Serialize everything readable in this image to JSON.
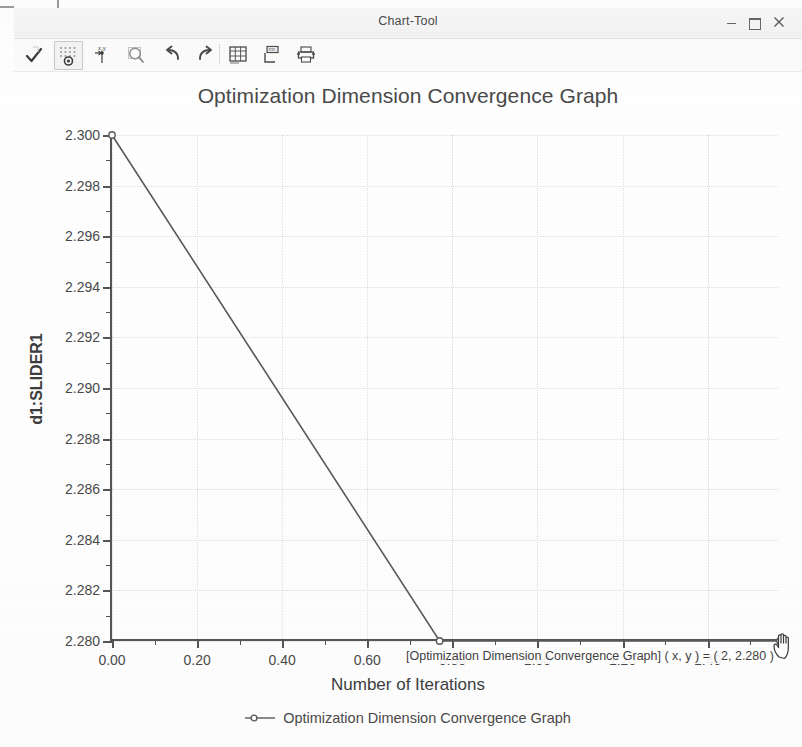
{
  "window": {
    "title": "Chart-Tool",
    "controls": {
      "minimize": "–",
      "maximize": "❐",
      "close": "×"
    }
  },
  "toolbar": {
    "items": [
      {
        "name": "accept-check-icon",
        "label": "Accept",
        "active": false
      },
      {
        "name": "data-points-grid-icon",
        "label": "Show Data Points",
        "active": true
      },
      {
        "name": "xy-crosshair-icon",
        "label": "X,Y Crosshair",
        "active": false
      },
      {
        "name": "magnifier-zoom-icon",
        "label": "Zoom",
        "active": false
      },
      {
        "name": "undo-icon",
        "label": "Undo",
        "active": false
      },
      {
        "name": "redo-icon",
        "label": "Redo",
        "active": false
      },
      {
        "name": "table-view-icon",
        "label": "Table View",
        "active": false
      },
      {
        "name": "text-label-icon",
        "label": "Edit Labels",
        "active": false
      },
      {
        "name": "print-icon",
        "label": "Print",
        "active": false
      }
    ]
  },
  "chart_data": {
    "type": "line",
    "title": "Optimization Dimension Convergence Graph",
    "xlabel": "Number of Iterations",
    "ylabel": "d1:SLIDER1",
    "xlim": [
      0.0,
      1.57
    ],
    "ylim": [
      2.28,
      2.3
    ],
    "xticks": [
      "0.00",
      "0.20",
      "0.40",
      "0.60",
      "0.80",
      "1.00",
      "1.20",
      "1.40"
    ],
    "xtick_values": [
      0.0,
      0.2,
      0.4,
      0.6,
      0.8,
      1.0,
      1.2,
      1.4
    ],
    "yticks": [
      "2.280",
      "2.282",
      "2.284",
      "2.286",
      "2.288",
      "2.290",
      "2.292",
      "2.294",
      "2.296",
      "2.298",
      "2.300"
    ],
    "ytick_values": [
      2.28,
      2.282,
      2.284,
      2.286,
      2.288,
      2.29,
      2.292,
      2.294,
      2.296,
      2.298,
      2.3
    ],
    "grid": true,
    "legend_position": "bottom",
    "series": [
      {
        "name": "Optimization Dimension Convergence Graph",
        "color": "#5a5a5a",
        "marker": "circle",
        "x": [
          0.0,
          0.77,
          1.57
        ],
        "y": [
          2.3,
          2.28,
          2.28
        ]
      }
    ]
  },
  "tooltip": {
    "text": "[Optimization Dimension Convergence Graph]  ( x, y ) = ( 2, 2.280 )"
  },
  "legend": {
    "entries": [
      {
        "label": "Optimization Dimension Convergence Graph",
        "color": "#5a5a5a"
      }
    ]
  }
}
